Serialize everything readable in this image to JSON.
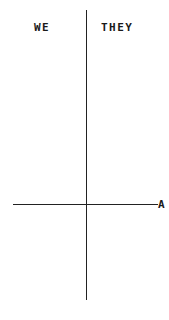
{
  "diagram": {
    "left_label": "WE",
    "right_label": "THEY",
    "axis_label": "A"
  }
}
